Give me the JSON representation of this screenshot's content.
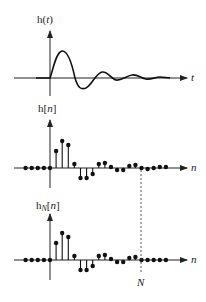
{
  "panels": {
    "continuous": {
      "ylabel_prefix": "h(",
      "ylabel_var": "t",
      "ylabel_suffix": ")",
      "xlabel": "t"
    },
    "discrete": {
      "ylabel_prefix": "h[",
      "ylabel_var": "n",
      "ylabel_suffix": "]",
      "xlabel": "n"
    },
    "truncated": {
      "ylabel_prefix": "h",
      "ylabel_sub": "N",
      "ylabel_bracket_open": "[",
      "ylabel_var": "n",
      "ylabel_bracket_close": "]",
      "xlabel": "n",
      "marker_label": "N"
    }
  },
  "chart_data": [
    {
      "type": "line",
      "title": "h(t)",
      "xlabel": "t",
      "ylabel": "h(t)",
      "description": "Damped oscillatory continuous-time impulse response starting at t=0"
    },
    {
      "type": "stem",
      "title": "h[n]",
      "xlabel": "n",
      "ylabel": "h[n]",
      "n": [
        -4,
        -3,
        -2,
        -1,
        0,
        1,
        2,
        3,
        4,
        5,
        6,
        7,
        8,
        9,
        10,
        11,
        12,
        13,
        14,
        15,
        16,
        17,
        18,
        19
      ],
      "values": [
        0,
        0,
        0,
        0,
        0,
        17,
        27,
        23,
        4,
        -10,
        -10,
        -6,
        4,
        5,
        1,
        -2,
        -2,
        2,
        3,
        0,
        -1,
        0,
        1,
        1
      ]
    },
    {
      "type": "stem",
      "title": "h_N[n]",
      "xlabel": "n",
      "ylabel": "h_N[n]",
      "truncation_index": "N",
      "n": [
        -4,
        -3,
        -2,
        -1,
        0,
        1,
        2,
        3,
        4,
        5,
        6,
        7,
        8,
        9,
        10,
        11,
        12,
        13,
        14,
        15,
        16,
        17,
        18,
        19
      ],
      "values": [
        0,
        0,
        0,
        0,
        0,
        17,
        27,
        23,
        4,
        -10,
        -10,
        -6,
        4,
        5,
        1,
        -2,
        -2,
        2,
        3,
        0,
        0,
        0,
        0,
        0
      ]
    }
  ]
}
